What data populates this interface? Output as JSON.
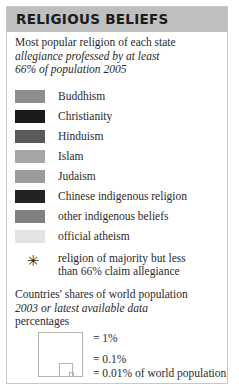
{
  "panel": {
    "title": "RELIGIOUS BELIEFS",
    "header_bg": "#bfbfbf",
    "border_color": "#c9c9c9",
    "text_color": "#2b2b2b"
  },
  "intro": {
    "line1": "Most popular religion of each state",
    "line2": "allegiance professed by at least",
    "line3": "66% of population 2005"
  },
  "legend": {
    "items": [
      {
        "label": "Buddhism",
        "color": "#8e8e8e"
      },
      {
        "label": "Christianity",
        "color": "#1a1a1a"
      },
      {
        "label": "Hinduism",
        "color": "#5a5a5a"
      },
      {
        "label": "Islam",
        "color": "#a6a6a6"
      },
      {
        "label": "Judaism",
        "color": "#9b9b9b"
      },
      {
        "label": "Chinese indigenous religion",
        "color": "#232323"
      },
      {
        "label": "other indigenous beliefs",
        "color": "#808080"
      },
      {
        "label": "official atheism",
        "color": "#e4e4e4"
      }
    ]
  },
  "asterisk_note": {
    "symbol": "✳",
    "line1": "religion of majority but less",
    "line2": "than 66% claim allegiance"
  },
  "shares": {
    "line1": "Countries' shares of world population",
    "line2": "2003 or latest available data",
    "line3": "percentages"
  },
  "scale": {
    "large_label": "= 1%",
    "mid_label": "= 0.1%",
    "small_label": "= 0.01% of world population"
  }
}
